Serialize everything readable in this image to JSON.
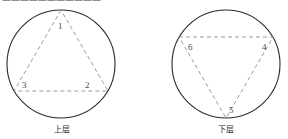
{
  "figure": {
    "top_cut_text": "———————————",
    "diagrams": [
      {
        "id": "upper-layer",
        "caption": "上层",
        "circle": {
          "cx": 61,
          "cy": 64,
          "r": 54
        },
        "triangle_orientation": "point-up",
        "vertices": [
          {
            "label": "1",
            "x": 61,
            "y": 10,
            "label_x": 58,
            "label_y": 26
          },
          {
            "label": "3",
            "x": 14,
            "y": 91,
            "label_x": 22,
            "label_y": 88
          },
          {
            "label": "2",
            "x": 108,
            "y": 91,
            "label_x": 85,
            "label_y": 88
          }
        ]
      },
      {
        "id": "lower-layer",
        "caption": "下层",
        "circle": {
          "cx": 226,
          "cy": 64,
          "r": 54
        },
        "triangle_orientation": "point-down",
        "vertices": [
          {
            "label": "6",
            "x": 179,
            "y": 37,
            "label_x": 188,
            "label_y": 47
          },
          {
            "label": "4",
            "x": 273,
            "y": 37,
            "label_x": 262,
            "label_y": 47
          },
          {
            "label": "5",
            "x": 226,
            "y": 118,
            "label_x": 229,
            "label_y": 110
          }
        ]
      }
    ]
  },
  "colors": {
    "circle_stroke": "#2b2b2b",
    "triangle_stroke": "#8f8f8f",
    "label_text": "#4a4a4a",
    "caption_text": "#2b2b2b",
    "background": "#ffffff"
  }
}
